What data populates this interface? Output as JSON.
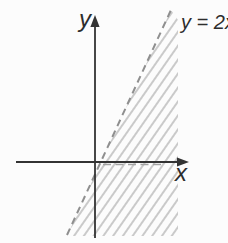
{
  "figure": {
    "kind": "dashed-line-with-hatched-region-sketch",
    "x_axis_label": "x",
    "y_axis_label": "y",
    "line_label": "y = 2x",
    "line_style": "dashed",
    "region_fill": "diagonal-hatch-right-of-line",
    "colors": {
      "background": "#fcfcfc",
      "axis": "#333333",
      "text": "#2d2d2d",
      "dash": "#8f8f8f",
      "dash-light": "#a3a3a3",
      "hatch": "#b5b5b5"
    }
  }
}
